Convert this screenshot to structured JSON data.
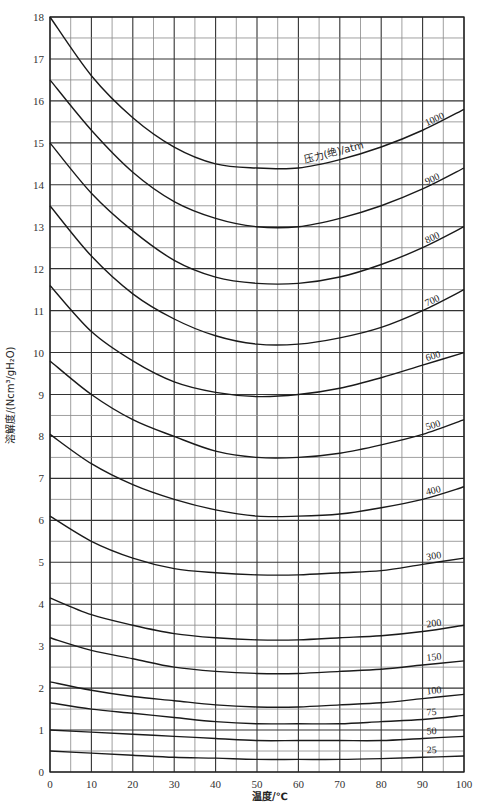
{
  "chart_data": {
    "type": "line",
    "title": "",
    "xlabel": "温度/℃",
    "ylabel": "溶解度/(Ncm³/gH₂O)",
    "xlim": [
      0,
      100
    ],
    "ylim": [
      0,
      18
    ],
    "x_ticks": [
      0,
      10,
      20,
      30,
      40,
      50,
      60,
      70,
      80,
      90,
      100
    ],
    "y_ticks": [
      0,
      1,
      2,
      3,
      4,
      5,
      6,
      7,
      8,
      9,
      10,
      11,
      12,
      13,
      14,
      15,
      16,
      17,
      18
    ],
    "grid": true,
    "grid_minor": {
      "x_step": 5,
      "y_step": 0.5
    },
    "legend_title": "压力(绝)/atm",
    "x": [
      0,
      10,
      20,
      30,
      40,
      50,
      60,
      70,
      80,
      90,
      100
    ],
    "series": [
      {
        "name": "1000",
        "values": [
          18.0,
          16.6,
          15.6,
          14.9,
          14.5,
          14.4,
          14.4,
          14.6,
          14.9,
          15.3,
          15.8
        ]
      },
      {
        "name": "900",
        "values": [
          16.5,
          15.3,
          14.3,
          13.6,
          13.2,
          13.0,
          13.0,
          13.2,
          13.5,
          13.9,
          14.4
        ]
      },
      {
        "name": "800",
        "values": [
          15.0,
          13.8,
          12.9,
          12.2,
          11.8,
          11.65,
          11.65,
          11.8,
          12.1,
          12.5,
          13.0
        ]
      },
      {
        "name": "700",
        "values": [
          13.5,
          12.3,
          11.4,
          10.8,
          10.4,
          10.2,
          10.2,
          10.35,
          10.6,
          11.0,
          11.5
        ]
      },
      {
        "name": "600",
        "values": [
          11.6,
          10.5,
          9.8,
          9.3,
          9.05,
          8.95,
          9.0,
          9.15,
          9.4,
          9.7,
          10.0
        ]
      },
      {
        "name": "500",
        "values": [
          9.8,
          9.0,
          8.4,
          8.0,
          7.65,
          7.5,
          7.5,
          7.6,
          7.8,
          8.05,
          8.4
        ]
      },
      {
        "name": "400",
        "values": [
          8.05,
          7.35,
          6.85,
          6.5,
          6.25,
          6.1,
          6.1,
          6.15,
          6.3,
          6.5,
          6.8
        ]
      },
      {
        "name": "300",
        "values": [
          6.1,
          5.5,
          5.1,
          4.85,
          4.75,
          4.7,
          4.7,
          4.75,
          4.8,
          4.95,
          5.1
        ]
      },
      {
        "name": "200",
        "values": [
          4.15,
          3.75,
          3.5,
          3.3,
          3.2,
          3.15,
          3.15,
          3.2,
          3.25,
          3.35,
          3.5
        ]
      },
      {
        "name": "150",
        "values": [
          3.2,
          2.9,
          2.7,
          2.5,
          2.4,
          2.35,
          2.35,
          2.4,
          2.45,
          2.55,
          2.65
        ]
      },
      {
        "name": "100",
        "values": [
          2.15,
          1.95,
          1.8,
          1.7,
          1.6,
          1.55,
          1.55,
          1.6,
          1.65,
          1.75,
          1.85
        ]
      },
      {
        "name": "75",
        "values": [
          1.65,
          1.5,
          1.4,
          1.3,
          1.2,
          1.15,
          1.15,
          1.15,
          1.2,
          1.25,
          1.35
        ]
      },
      {
        "name": "50",
        "values": [
          1.0,
          0.95,
          0.9,
          0.85,
          0.8,
          0.75,
          0.75,
          0.75,
          0.75,
          0.8,
          0.85
        ]
      },
      {
        "name": "25",
        "values": [
          0.5,
          0.45,
          0.4,
          0.35,
          0.33,
          0.3,
          0.3,
          0.3,
          0.32,
          0.35,
          0.38
        ]
      }
    ]
  },
  "colors": {
    "line": "#1a1a1a",
    "grid": "#555555",
    "background": "#ffffff"
  }
}
